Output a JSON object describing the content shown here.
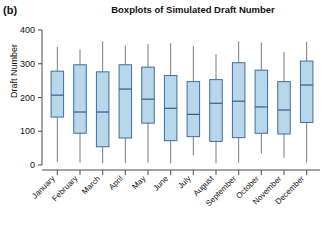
{
  "panel": {
    "label": "(b)"
  },
  "chart_data": {
    "type": "boxplot",
    "title": "Boxplots of Simulated Draft Number",
    "xlabel": "",
    "ylabel": "Draft Number",
    "ylim": [
      0,
      400
    ],
    "yticks": [
      0,
      100,
      200,
      300,
      400
    ],
    "ytick_labels": [
      "0",
      "100",
      "200",
      "300",
      "400"
    ],
    "grid": false,
    "legend": null,
    "categories": [
      "January",
      "February",
      "March",
      "April",
      "May",
      "June",
      "July",
      "August",
      "September",
      "October",
      "November",
      "December"
    ],
    "boxes": [
      {
        "category": "January",
        "whisker_low": 8,
        "q1": 142,
        "median": 207,
        "q3": 278,
        "whisker_high": 350
      },
      {
        "category": "February",
        "whisker_low": 7,
        "q1": 94,
        "median": 157,
        "q3": 297,
        "whisker_high": 342
      },
      {
        "category": "March",
        "whisker_low": 5,
        "q1": 54,
        "median": 157,
        "q3": 276,
        "whisker_high": 366
      },
      {
        "category": "April",
        "whisker_low": 6,
        "q1": 80,
        "median": 225,
        "q3": 297,
        "whisker_high": 354
      },
      {
        "category": "May",
        "whisker_low": 7,
        "q1": 124,
        "median": 195,
        "q3": 290,
        "whisker_high": 358
      },
      {
        "category": "June",
        "whisker_low": 5,
        "q1": 72,
        "median": 168,
        "q3": 265,
        "whisker_high": 361
      },
      {
        "category": "July",
        "whisker_low": 28,
        "q1": 84,
        "median": 150,
        "q3": 247,
        "whisker_high": 353
      },
      {
        "category": "August",
        "whisker_low": 5,
        "q1": 70,
        "median": 183,
        "q3": 253,
        "whisker_high": 329
      },
      {
        "category": "September",
        "whisker_low": 7,
        "q1": 81,
        "median": 189,
        "q3": 303,
        "whisker_high": 366
      },
      {
        "category": "October",
        "whisker_low": 33,
        "q1": 94,
        "median": 172,
        "q3": 281,
        "whisker_high": 363
      },
      {
        "category": "November",
        "whisker_low": 21,
        "q1": 92,
        "median": 163,
        "q3": 247,
        "whisker_high": 335
      },
      {
        "category": "December",
        "whisker_low": 7,
        "q1": 126,
        "median": 237,
        "q3": 308,
        "whisker_high": 365
      }
    ],
    "colors": {
      "box_fill": "#b9d7ea",
      "box_stroke": "#3c6e9c",
      "median": "#2f5d8a",
      "whisker": "#7a7a7a",
      "axis": "#4a4a4a",
      "text": "#111111",
      "background": "#ffffff"
    }
  }
}
